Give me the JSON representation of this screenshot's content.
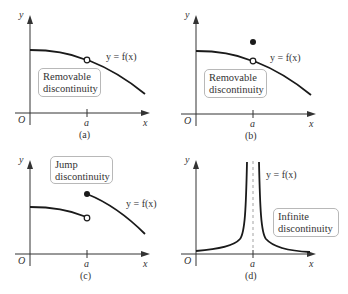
{
  "figure": {
    "panels": [
      {
        "id": "a",
        "caption": "(a)",
        "label": [
          "Removable",
          "discontinuity"
        ],
        "function_label": "y = f(x)",
        "axis": {
          "x": "x",
          "y": "y",
          "origin": "O",
          "tick": "a"
        },
        "features": {
          "open_circle_at_a": true,
          "filled_point_at_a": false
        }
      },
      {
        "id": "b",
        "caption": "(b)",
        "label": [
          "Removable",
          "discontinuity"
        ],
        "function_label": "y = f(x)",
        "axis": {
          "x": "x",
          "y": "y",
          "origin": "O",
          "tick": "a"
        },
        "features": {
          "open_circle_at_a": true,
          "filled_point_above": true
        }
      },
      {
        "id": "c",
        "caption": "(c)",
        "label": [
          "Jump",
          "discontinuity"
        ],
        "function_label": "y = f(x)",
        "axis": {
          "x": "x",
          "y": "y",
          "origin": "O",
          "tick": "a"
        },
        "features": {
          "open_circle_left_limit": true,
          "filled_point_right_branch": true
        }
      },
      {
        "id": "d",
        "caption": "(d)",
        "label": [
          "Infinite",
          "discontinuity"
        ],
        "function_label": "y = f(x)",
        "axis": {
          "x": "x",
          "y": "y",
          "origin": "O",
          "tick": "a"
        },
        "features": {
          "vertical_asymptote_dashed": true
        }
      }
    ],
    "colors": {
      "curve": "#1a1a1a",
      "axis": "#333333",
      "box_border": "#b8b8b8",
      "asymptote": "#999999"
    }
  }
}
